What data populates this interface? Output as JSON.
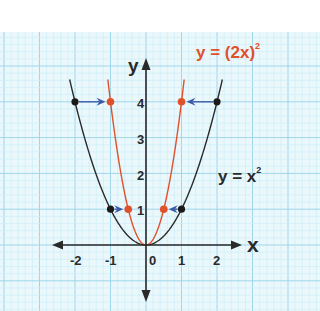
{
  "chart_data": {
    "type": "line",
    "title": "",
    "xlabel": "x",
    "ylabel": "y",
    "x_ticks": [
      "-2",
      "-1",
      "0",
      "1",
      "2"
    ],
    "y_ticks": [
      "1",
      "2",
      "3",
      "4"
    ],
    "xlim": [
      -2.6,
      2.6
    ],
    "ylim": [
      -1.6,
      5.0
    ],
    "grid": true,
    "series": [
      {
        "name": "y = x²",
        "color": "#2a2a2a",
        "function": "x^2",
        "label": "y = x",
        "label_sup": "2"
      },
      {
        "name": "y = (2x)²",
        "color": "#e0502a",
        "function": "(2x)^2",
        "label": "y = (2x)",
        "label_sup": "2"
      }
    ],
    "points": {
      "black": [
        [
          -2,
          4
        ],
        [
          2,
          4
        ],
        [
          -1,
          1
        ],
        [
          1,
          1
        ]
      ],
      "red": [
        [
          -1,
          4
        ],
        [
          1,
          4
        ],
        [
          -0.5,
          1
        ],
        [
          0.5,
          1
        ]
      ]
    },
    "arrows": [
      {
        "from": [
          -2,
          4
        ],
        "to": [
          -1,
          4
        ]
      },
      {
        "from": [
          2,
          4
        ],
        "to": [
          1,
          4
        ]
      },
      {
        "from": [
          -1,
          1
        ],
        "to": [
          -0.5,
          1
        ]
      },
      {
        "from": [
          1,
          1
        ],
        "to": [
          0.5,
          1
        ]
      }
    ],
    "colors": {
      "grid_minor": "#cdeef7",
      "grid_major": "#9fd6ea",
      "background": "#eaf8fc",
      "axis": "#2a2a2a",
      "arrow": "#3b5aa8"
    }
  },
  "labels": {
    "x_axis": "x",
    "y_axis": "y",
    "curve1": "y = x",
    "curve1_sup": "2",
    "curve2": "y = (2x)",
    "curve2_sup": "2",
    "tick_x": [
      "-2",
      "-1",
      "0",
      "1",
      "2"
    ],
    "tick_y": [
      "1",
      "2",
      "3",
      "4"
    ]
  }
}
